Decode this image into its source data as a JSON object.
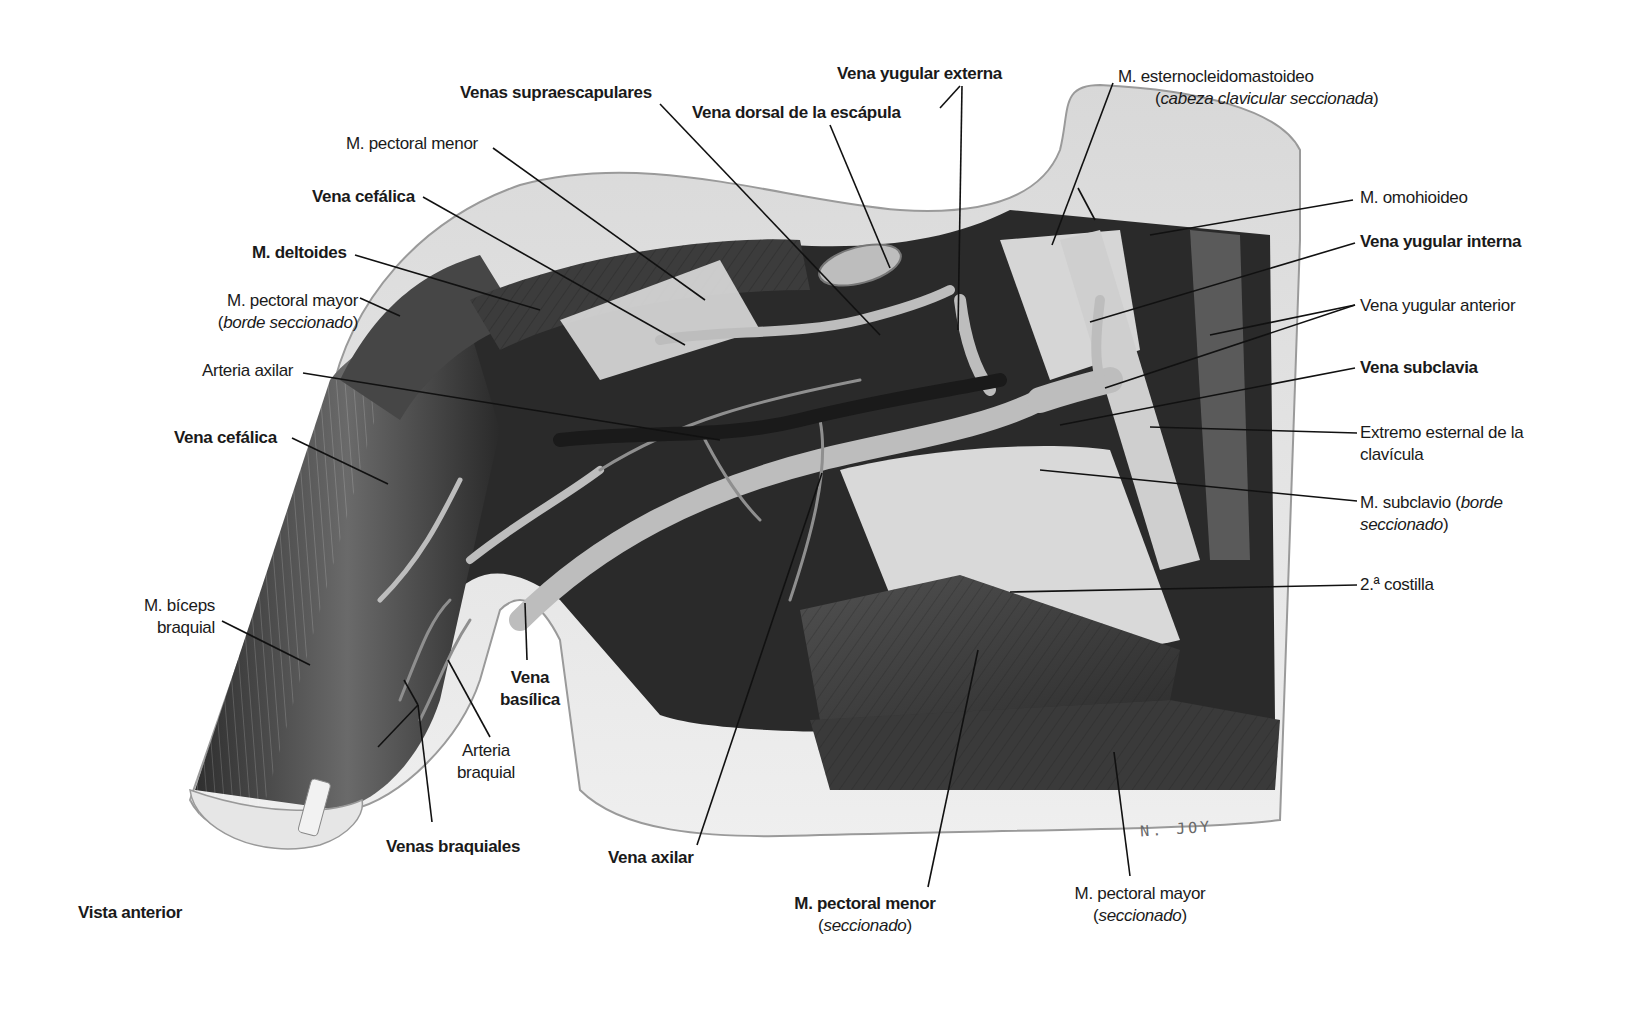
{
  "figure": {
    "view_label": "Vista anterior",
    "signature": "N. JOY",
    "colors": {
      "background": "#ffffff",
      "label": "#1a1a1a",
      "skin": "#e4e4e4",
      "muscle_dark": "#3a3a3a",
      "vessel": "#b9b9b9"
    },
    "labels": [
      {
        "id": "venas-supraescapulares",
        "text": "Venas supraescapulares",
        "bold": true
      },
      {
        "id": "vena-yugular-externa",
        "text": "Vena yugular externa",
        "bold": true
      },
      {
        "id": "vena-dorsal-escapula",
        "text": "Vena dorsal de la escápula",
        "bold": true
      },
      {
        "id": "m-pectoral-menor-top",
        "text": "M. pectoral menor",
        "bold": false
      },
      {
        "id": "vena-cefalica-top",
        "text": "Vena cefálica",
        "bold": true
      },
      {
        "id": "m-deltoides",
        "text": "M. deltoides",
        "bold": true
      },
      {
        "id": "m-pectoral-mayor-left",
        "text": "M. pectoral mayor",
        "note": "borde seccionado",
        "bold": false
      },
      {
        "id": "arteria-axilar",
        "text": "Arteria axilar",
        "bold": false
      },
      {
        "id": "vena-cefalica-left",
        "text": "Vena cefálica",
        "bold": true
      },
      {
        "id": "m-biceps-braquial",
        "text": "M. bíceps braquial",
        "line1": "M. bíceps",
        "line2": "braquial",
        "bold": false
      },
      {
        "id": "vena-basilica",
        "text": "Vena basílica",
        "line1": "Vena",
        "line2": "basílica",
        "bold": true
      },
      {
        "id": "arteria-braquial",
        "text": "Arteria braquial",
        "line1": "Arteria",
        "line2": "braquial",
        "bold": false
      },
      {
        "id": "venas-braquiales",
        "text": "Venas braquiales",
        "bold": true
      },
      {
        "id": "vena-axilar",
        "text": "Vena axilar",
        "bold": true
      },
      {
        "id": "m-pectoral-menor-bottom",
        "text": "M. pectoral menor",
        "note": "seccionado",
        "bold": true
      },
      {
        "id": "m-pectoral-mayor-bottom",
        "text": "M. pectoral mayor",
        "note": "seccionado",
        "bold": false
      },
      {
        "id": "m-esternocleidomastoideo",
        "text": "M. esternocleidomastoideo",
        "note": "cabeza clavicular seccionada",
        "bold": false
      },
      {
        "id": "m-omohioideo",
        "text": "M. omohioideo",
        "bold": false
      },
      {
        "id": "vena-yugular-interna",
        "text": "Vena yugular interna",
        "bold": true
      },
      {
        "id": "vena-yugular-anterior",
        "text": "Vena yugular anterior",
        "bold": false
      },
      {
        "id": "vena-subclavia",
        "text": "Vena subclavia",
        "bold": true
      },
      {
        "id": "extremo-esternal-clavicula",
        "text": "Extremo esternal de la clavícula",
        "line1": "Extremo esternal de la",
        "line2": "clavícula",
        "bold": false
      },
      {
        "id": "m-subclavio",
        "text": "M. subclavio",
        "note": "borde seccionado",
        "line1_prefix": "M. subclavio (",
        "line1_italic": "borde",
        "line2_italic": "seccionado",
        "bold": false
      },
      {
        "id": "segunda-costilla",
        "text": "2.ª costilla",
        "bold": false
      }
    ]
  }
}
